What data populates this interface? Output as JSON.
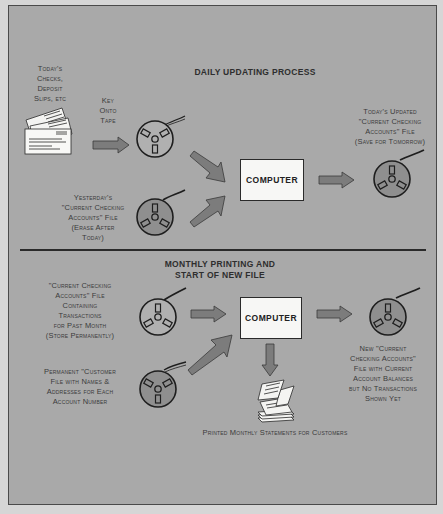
{
  "colors": {
    "background": "#a9a9a9",
    "outside": "#d6d6d6",
    "reel_dark_fill": "#8f8f8f",
    "arrow_fill": "#7c7c7c",
    "computer_fill": "#f7f7f5",
    "text": "#3a3a3a"
  },
  "daily": {
    "title": "DAILY UPDATING PROCESS",
    "input_docs_label": [
      "Today's",
      "Checks,",
      "Deposit",
      "Slips, etc"
    ],
    "key_label": [
      "Key",
      "Onto",
      "Tape"
    ],
    "yesterday_label": [
      "Yesterday's",
      "\"Current Checking",
      "Accounts\" File",
      "(Erase After",
      "Today)"
    ],
    "computer_label": "COMPUTER",
    "output_label": [
      "Today's Updated",
      "\"Current Checking",
      "Accounts\" File",
      "(Save for Tomorrow)"
    ]
  },
  "monthly": {
    "title_line1": "MONTHLY PRINTING AND",
    "title_line2": "START OF NEW FILE",
    "current_file_label": [
      "\"Current Checking",
      "Accounts\" File",
      "Containing",
      "Transactions",
      "for Past Month",
      "(Store Permanently)"
    ],
    "customer_file_label": [
      "Permanent \"Customer",
      "File with Names &",
      "Addresses for Each",
      "Account Number"
    ],
    "computer_label": "COMPUTER",
    "new_file_label": [
      "New \"Current",
      "Checking Accounts\"",
      "File with Current",
      "Account Balances",
      "but No Transactions",
      "Shown Yet"
    ],
    "statements_label": "Printed Monthly Statements for Customers"
  }
}
